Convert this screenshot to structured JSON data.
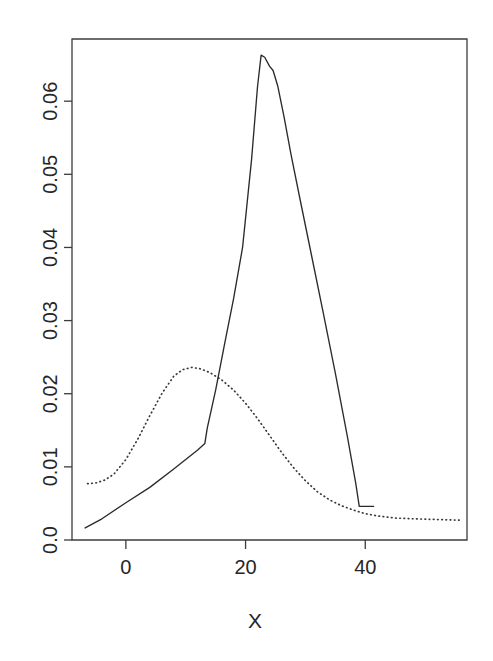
{
  "chart_data": {
    "type": "line",
    "title": "",
    "subtitle": "",
    "xlabel": "X",
    "ylabel": "",
    "xlim": [
      -9,
      57
    ],
    "ylim": [
      0,
      0.0685
    ],
    "grid": false,
    "legend": null,
    "x_ticks": [
      0,
      20,
      40
    ],
    "x_tick_labels": [
      "0",
      "20",
      "40"
    ],
    "y_ticks": [
      0.0,
      0.01,
      0.02,
      0.03,
      0.04,
      0.05,
      0.06
    ],
    "y_tick_labels": [
      "0.0",
      "0.01",
      "0.02",
      "0.03",
      "0.04",
      "0.05",
      "0.06"
    ],
    "y_tick_label_rotation": 90,
    "series": [
      {
        "name": "solid",
        "style": "solid",
        "color": "#2b2b2b",
        "x": [
          -6.8,
          -4.0,
          0.0,
          4.0,
          8.0,
          12.0,
          13.2,
          13.6,
          15.0,
          16.5,
          18.0,
          19.5,
          21.0,
          22.0,
          22.6,
          23.2,
          24.0,
          24.6,
          25.4,
          26.4,
          27.6,
          29.0,
          31.0,
          33.0,
          35.0,
          37.0,
          38.4,
          39.0,
          40.0,
          41.4
        ],
        "y": [
          0.00165,
          0.0029,
          0.0051,
          0.0072,
          0.0097,
          0.0123,
          0.0132,
          0.0153,
          0.0205,
          0.0268,
          0.033,
          0.04,
          0.052,
          0.062,
          0.0663,
          0.066,
          0.0648,
          0.0642,
          0.062,
          0.058,
          0.0527,
          0.047,
          0.039,
          0.031,
          0.0228,
          0.0142,
          0.0078,
          0.0046,
          0.0046,
          0.0046
        ]
      },
      {
        "name": "dotted",
        "style": "dotted",
        "color": "#3a3a3a",
        "x": [
          -6.4,
          -5.0,
          -3.5,
          -2.0,
          0.0,
          2.0,
          4.0,
          6.0,
          8.0,
          9.5,
          11.0,
          12.5,
          14.0,
          16.0,
          18.0,
          20.0,
          22.0,
          24.0,
          26.0,
          28.0,
          30.0,
          32.0,
          34.0,
          36.0,
          38.0,
          40.0,
          42.0,
          45.0,
          48.0,
          52.0,
          56.0
        ],
        "y": [
          0.0077,
          0.0078,
          0.0082,
          0.009,
          0.011,
          0.0138,
          0.017,
          0.02,
          0.0224,
          0.0233,
          0.0236,
          0.0234,
          0.0229,
          0.0219,
          0.0205,
          0.0187,
          0.0166,
          0.0143,
          0.012,
          0.0099,
          0.0081,
          0.0066,
          0.0055,
          0.0047,
          0.0041,
          0.0036,
          0.0033,
          0.003,
          0.0029,
          0.0028,
          0.0027
        ]
      }
    ]
  },
  "axes": {
    "plot_left_px": 72,
    "plot_right_px": 467,
    "plot_top_px": 39,
    "plot_bottom_px": 540
  }
}
